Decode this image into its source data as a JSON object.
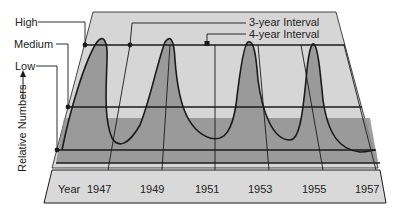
{
  "diagram": {
    "type": "population-cycle-3d-panel",
    "level_labels": {
      "high": "High",
      "medium": "Medium",
      "low": "Low"
    },
    "y_axis_label": "Relative Numbers",
    "x_axis": {
      "label": "Year",
      "ticks": [
        "1947",
        "1949",
        "1951",
        "1953",
        "1955",
        "1957"
      ]
    },
    "legend": {
      "three_year": "3-year Interval",
      "four_year": "4-year Interval"
    },
    "colors": {
      "back_panel": "#d6d6d6",
      "front_band": "#8f8f8f",
      "curve_fill": "#9a9a9a",
      "year_strip": "#d9d9d9",
      "line": "#1a1a1a"
    }
  }
}
